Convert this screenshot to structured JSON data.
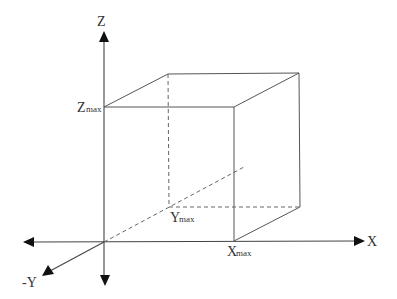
{
  "diagram": {
    "type": "3d-coordinate-box",
    "axes": {
      "z_label": "Z",
      "x_label": "X",
      "neg_y_label": "-Y"
    },
    "vertex_labels": {
      "z_max_main": "Z",
      "z_max_sub": "max",
      "y_max_main": "Y",
      "y_max_sub": "max",
      "x_max_main": "X",
      "x_max_sub": "max"
    },
    "colors": {
      "line": "#555555",
      "arrow": "#111111",
      "text": "#333333",
      "background": "#ffffff"
    }
  }
}
